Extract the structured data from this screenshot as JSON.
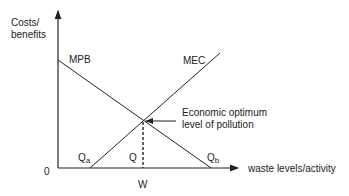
{
  "diagram": {
    "y_axis_label_line1": "Costs/",
    "y_axis_label_line2": "benefits",
    "x_axis_label": "waste levels/activity",
    "origin_label": "0",
    "curves": {
      "mpb": {
        "label": "MPB",
        "description": "Marginal private benefit, downward sloping"
      },
      "mec": {
        "label": "MEC",
        "description": "Marginal external cost, upward sloping"
      }
    },
    "points": {
      "qa": {
        "base": "Q",
        "sub": "a"
      },
      "q": {
        "base": "Q"
      },
      "qb": {
        "base": "Q",
        "sub": "b"
      },
      "w": "W"
    },
    "annotation_line1": "Economic optimum",
    "annotation_line2": "level of pollution",
    "colors": {
      "line": "#222222",
      "background": "#ffffff"
    }
  }
}
